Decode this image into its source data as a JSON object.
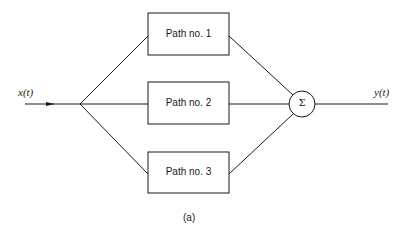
{
  "input_signal": "x(t)",
  "output_signal": "y(t)",
  "paths": [
    {
      "label": "Path no. 1"
    },
    {
      "label": "Path no. 2"
    },
    {
      "label": "Path no. 3"
    }
  ],
  "summer": {
    "symbol": "Σ"
  },
  "caption": "(a)"
}
